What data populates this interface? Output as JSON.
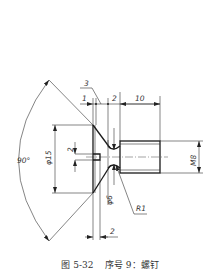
{
  "figure": {
    "caption_number": "图 5-32",
    "caption_text": "序号 9：螺钉",
    "caption_full": "图 5-32    序号 9：螺钉"
  },
  "dimensions": {
    "head_chamfer": "3",
    "head_face_width": "1",
    "neck_width": "2",
    "shank_length": "10",
    "head_diameter": "φ15",
    "slot_width": "2",
    "thread": "M8",
    "neck_diameter": "φ6",
    "neck_radius": "R1",
    "slot_depth": "2",
    "head_angle": "90°"
  },
  "colors": {
    "line": "#1a1a1a",
    "background": "#ffffff"
  }
}
